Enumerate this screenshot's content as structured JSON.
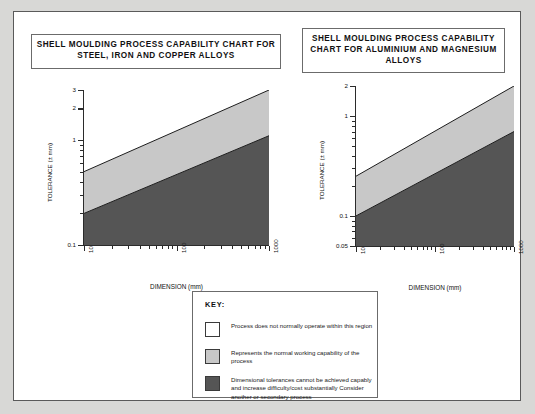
{
  "page": {
    "background_color": "#d8d8d6",
    "panel_color": "#ffffff",
    "border_color": "#5a5a5a"
  },
  "colors": {
    "white_region": "#ffffff",
    "light_gray_region": "#c8c8c8",
    "dark_gray_region": "#555555",
    "axis": "#2b2b2b",
    "text": "#111111"
  },
  "titles": {
    "left": "SHELL MOULDING PROCESS CAPABILITY CHART FOR STEEL, IRON AND COPPER ALLOYS",
    "right": "SHELL MOULDING PROCESS CAPABILITY CHART FOR ALUMINIUM AND MAGNESIUM ALLOYS"
  },
  "key": {
    "heading": "KEY:",
    "items": [
      {
        "swatch": "#ffffff",
        "label": "Process does not normally operate within this region"
      },
      {
        "swatch": "#c8c8c8",
        "label": "Represents the normal working capability of the process"
      },
      {
        "swatch": "#555555",
        "label": "Dimensional tolerances cannot be achieved capably and increase difficulty/cost substantially Consider another or secondary process"
      }
    ]
  },
  "chart_data": [
    {
      "type": "area",
      "id": "steel-iron-copper",
      "title": "SHELL MOULDING PROCESS CAPABILITY CHART FOR STEEL, IRON AND COPPER ALLOYS",
      "xlabel": "DIMENSION (mm)",
      "ylabel": "TOLERANCE (± mm)",
      "xscale": "log",
      "yscale": "log",
      "xlim": [
        10,
        1000
      ],
      "ylim": [
        0.1,
        3
      ],
      "xticks": [
        10,
        100,
        1000
      ],
      "xticklabels": [
        "10",
        "100",
        "1000"
      ],
      "yticks": [
        0.1,
        1,
        2,
        3
      ],
      "yticklabels": [
        "0.1",
        "1",
        "2",
        "3"
      ],
      "grid": false,
      "legend": "none",
      "series": [
        {
          "name": "Upper boundary (white / normal working capability)",
          "x": [
            10,
            1000
          ],
          "y": [
            0.5,
            3.0
          ]
        },
        {
          "name": "Lower boundary (normal working capability / difficult)",
          "x": [
            10,
            1000
          ],
          "y": [
            0.2,
            1.1
          ]
        }
      ],
      "regions": [
        {
          "name": "Process does not normally operate within this region",
          "fill": "#ffffff"
        },
        {
          "name": "Represents the normal working capability of the process",
          "fill": "#c8c8c8"
        },
        {
          "name": "Dimensional tolerances cannot be achieved capably",
          "fill": "#555555"
        }
      ]
    },
    {
      "type": "area",
      "id": "aluminium-magnesium",
      "title": "SHELL MOULDING PROCESS CAPABILITY CHART FOR ALUMINIUM AND MAGNESIUM ALLOYS",
      "xlabel": "DIMENSION (mm)",
      "ylabel": "TOLERANCE (± mm)",
      "xscale": "log",
      "yscale": "log",
      "xlim": [
        10,
        1000
      ],
      "ylim": [
        0.05,
        2
      ],
      "xticks": [
        10,
        100,
        1000
      ],
      "xticklabels": [
        "10",
        "100",
        "1000"
      ],
      "yticks": [
        0.05,
        0.1,
        1,
        2
      ],
      "yticklabels": [
        "0.05",
        "0.1",
        "1",
        "2"
      ],
      "grid": false,
      "legend": "none",
      "series": [
        {
          "name": "Upper boundary (white / normal working capability)",
          "x": [
            10,
            1000
          ],
          "y": [
            0.25,
            2.0
          ]
        },
        {
          "name": "Lower boundary (normal working capability / difficult)",
          "x": [
            10,
            1000
          ],
          "y": [
            0.1,
            0.7
          ]
        }
      ],
      "regions": [
        {
          "name": "Process does not normally operate within this region",
          "fill": "#ffffff"
        },
        {
          "name": "Represents the normal working capability of the process",
          "fill": "#c8c8c8"
        },
        {
          "name": "Dimensional tolerances cannot be achieved capably",
          "fill": "#555555"
        }
      ]
    }
  ]
}
